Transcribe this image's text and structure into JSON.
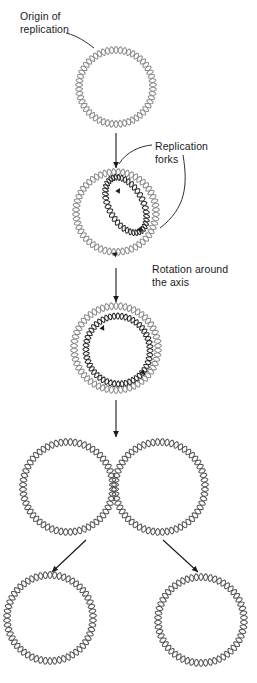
{
  "diagram": {
    "type": "biology-process-diagram",
    "labels": {
      "origin": "Origin of\nreplication",
      "forks": "Replication\nforks",
      "rotation": "Rotation around\nthe axis"
    },
    "colors": {
      "dna_light": "#8c8c8c",
      "dna_dark": "#2b2b2b",
      "arrow": "#1a1a1a",
      "leader": "#1a1a1a",
      "background": "#ffffff",
      "text": "#1a1a1a"
    },
    "stages": [
      {
        "id": "stage-1-parent-circle",
        "name": "parent-circular-dna",
        "cx": 116,
        "cy": 87,
        "r": 37,
        "waves": 27,
        "amplitude": 3.4,
        "stroke": "#8c8c8c"
      },
      {
        "id": "stage-2-early-theta",
        "name": "early-theta-structure",
        "cx": 116,
        "cy": 212,
        "r": 40,
        "waves": 28,
        "amplitude": 3.4,
        "stroke": "#8c8c8c",
        "bubble": {
          "cx": 126,
          "cy": 205,
          "rx": 17,
          "ry": 30,
          "rot": -28,
          "waves": 20,
          "amplitude": 3.0,
          "stroke": "#2b2b2b"
        }
      },
      {
        "id": "stage-3-late-theta",
        "name": "late-theta-structure",
        "cx": 116,
        "cy": 348,
        "r": 42,
        "waves": 29,
        "amplitude": 3.4,
        "stroke": "#8c8c8c",
        "bubble": {
          "cx": 118,
          "cy": 350,
          "rx": 32,
          "ry": 34,
          "rot": -10,
          "waves": 26,
          "amplitude": 3.0,
          "stroke": "#2b2b2b"
        }
      },
      {
        "id": "stage-4-catenated",
        "name": "interlocked-daughter-circles",
        "left": {
          "cx": 68,
          "cy": 487,
          "r": 45,
          "waves": 30,
          "amplitude": 3.4,
          "stroke": "#555555"
        },
        "right": {
          "cx": 160,
          "cy": 487,
          "r": 45,
          "waves": 30,
          "amplitude": 3.4,
          "stroke": "#555555"
        }
      },
      {
        "id": "stage-5-separated",
        "name": "separated-daughter-circles",
        "left": {
          "cx": 50,
          "cy": 618,
          "r": 43,
          "waves": 29,
          "amplitude": 3.4,
          "stroke": "#555555"
        },
        "right": {
          "cx": 201,
          "cy": 620,
          "r": 43,
          "waves": 29,
          "amplitude": 3.4,
          "stroke": "#555555"
        }
      }
    ],
    "arrows": [
      {
        "name": "arrow-stage1-to-stage2",
        "x1": 116,
        "y1": 133,
        "x2": 116,
        "y2": 168
      },
      {
        "name": "arrow-stage2-to-stage3",
        "x1": 116,
        "y1": 268,
        "x2": 116,
        "y2": 302
      },
      {
        "name": "arrow-stage3-to-stage4",
        "x1": 116,
        "y1": 400,
        "x2": 116,
        "y2": 437
      },
      {
        "name": "arrow-stage4-to-left-daughter",
        "x1": 86,
        "y1": 540,
        "x2": 52,
        "y2": 572
      },
      {
        "name": "arrow-stage4-to-right-daughter",
        "x1": 163,
        "y1": 540,
        "x2": 198,
        "y2": 572
      }
    ],
    "fork_arrowheads": [
      {
        "name": "fork-arrowhead-upper-stage2",
        "x": 120,
        "y": 188,
        "angle": -60
      },
      {
        "name": "fork-arrowhead-lower-stage2",
        "x": 142,
        "y": 232,
        "angle": 55
      },
      {
        "name": "fork-arrowhead-rotation-stage2",
        "x": 112,
        "y": 253,
        "angle": 200
      },
      {
        "name": "fork-arrowhead-upper-stage3",
        "x": 104,
        "y": 325,
        "angle": -65
      },
      {
        "name": "fork-arrowhead-lower-stage3",
        "x": 145,
        "y": 375,
        "angle": 50
      }
    ],
    "leaders": [
      {
        "name": "leader-origin-to-circle",
        "d": "M 66 33 C 78 36, 86 42, 94 48"
      },
      {
        "name": "leader-forks-to-upper-fork",
        "d": "M 152 145 C 140 146, 126 152, 119 164"
      },
      {
        "name": "leader-forks-to-lower-fork",
        "d": "M 183 155 C 188 185, 186 208, 160 228"
      }
    ]
  }
}
